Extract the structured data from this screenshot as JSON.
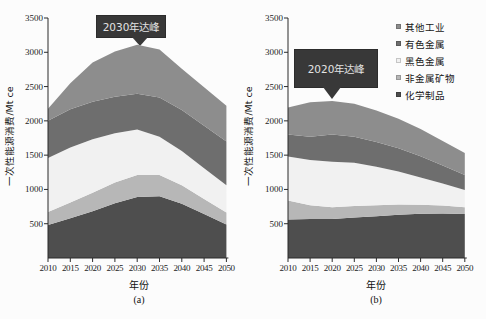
{
  "figure": {
    "y_axis_label": "一次性能源消费/Mt ce",
    "x_axis_label": "年份",
    "y_ticks": [
      3500,
      3000,
      2500,
      2000,
      1500,
      1000,
      500
    ],
    "legend": [
      {
        "label": "其他工业",
        "color": "#8d8d8d"
      },
      {
        "label": "有色金属",
        "color": "#6e6e6e"
      },
      {
        "label": "黑色金属",
        "color": "#f1f1f1"
      },
      {
        "label": "非金属矿物",
        "color": "#b7b7b7"
      },
      {
        "label": "化学制品",
        "color": "#4e4e4e"
      }
    ],
    "legend_position": "top-right",
    "grid": false,
    "annotation_bg": "#383838",
    "annotation_text_color": "#e3e3e3"
  },
  "chart_data": [
    {
      "type": "area",
      "stacked": true,
      "panel": "(a)",
      "annotation": "2030年达峰",
      "xlabel": "年份",
      "ylabel": "一次性能源消费/Mt ce",
      "ylim": [
        0,
        3500
      ],
      "x": [
        2010,
        2015,
        2020,
        2025,
        2030,
        2035,
        2040,
        2045,
        2050
      ],
      "series": [
        {
          "name": "化学制品",
          "color": "#4e4e4e",
          "values": [
            480,
            580,
            680,
            800,
            890,
            900,
            790,
            640,
            490
          ]
        },
        {
          "name": "非金属矿物",
          "color": "#b7b7b7",
          "values": [
            190,
            230,
            270,
            300,
            320,
            310,
            270,
            220,
            175
          ]
        },
        {
          "name": "黑色金属",
          "color": "#f1f1f1",
          "values": [
            790,
            800,
            780,
            720,
            665,
            560,
            500,
            450,
            395
          ]
        },
        {
          "name": "有色金属",
          "color": "#6e6e6e",
          "values": [
            540,
            560,
            550,
            530,
            520,
            570,
            600,
            620,
            640
          ]
        },
        {
          "name": "其他工业",
          "color": "#8d8d8d",
          "values": [
            175,
            380,
            570,
            660,
            715,
            700,
            600,
            560,
            520
          ]
        }
      ]
    },
    {
      "type": "area",
      "stacked": true,
      "panel": "(b)",
      "annotation": "2020年达峰",
      "xlabel": "年份",
      "ylabel": "一次性能源消费/Mt ce",
      "ylim": [
        0,
        3500
      ],
      "x": [
        2010,
        2015,
        2020,
        2025,
        2030,
        2035,
        2040,
        2045,
        2050
      ],
      "series": [
        {
          "name": "化学制品",
          "color": "#4e4e4e",
          "values": [
            560,
            570,
            570,
            590,
            610,
            630,
            645,
            650,
            640
          ]
        },
        {
          "name": "非金属矿物",
          "color": "#b7b7b7",
          "values": [
            280,
            200,
            170,
            170,
            160,
            150,
            130,
            115,
            100
          ]
        },
        {
          "name": "黑色金属",
          "color": "#f1f1f1",
          "values": [
            640,
            660,
            665,
            630,
            560,
            480,
            400,
            320,
            250
          ]
        },
        {
          "name": "有色金属",
          "color": "#6e6e6e",
          "values": [
            320,
            340,
            395,
            380,
            360,
            340,
            310,
            265,
            220
          ]
        },
        {
          "name": "其他工业",
          "color": "#8d8d8d",
          "values": [
            395,
            500,
            490,
            480,
            460,
            430,
            395,
            355,
            320
          ]
        }
      ]
    }
  ]
}
